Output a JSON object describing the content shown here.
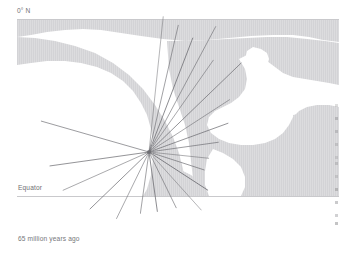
{
  "figure": {
    "caption": "65 million years ago",
    "latitude_label": "0° N",
    "equator_label": "Equator"
  },
  "chart_data": {
    "type": "map",
    "title": "65 million years ago",
    "annotations": [
      {
        "text": "0° N",
        "position": "top-left"
      },
      {
        "text": "Equator",
        "position": "left, above equator line"
      },
      {
        "text": "65 million years ago",
        "position": "bottom-left caption"
      }
    ],
    "reference_lines": [
      {
        "name": "top-border",
        "y": 19,
        "x_start": 17,
        "x_end": 339
      },
      {
        "name": "equator",
        "y": 196,
        "x_start": 17,
        "x_end": 339
      }
    ],
    "radial_burst": {
      "origin": {
        "x": 149,
        "y": 152
      },
      "ray_count": 21,
      "rays": [
        {
          "angle_deg": -84,
          "length": 136
        },
        {
          "angle_deg": -77,
          "length": 130
        },
        {
          "angle_deg": -69,
          "length": 122
        },
        {
          "angle_deg": -62,
          "length": 142
        },
        {
          "angle_deg": -55,
          "length": 112
        },
        {
          "angle_deg": -44,
          "length": 128
        },
        {
          "angle_deg": -33,
          "length": 96
        },
        {
          "angle_deg": -20,
          "length": 84
        },
        {
          "angle_deg": -8,
          "length": 70
        },
        {
          "angle_deg": 6,
          "length": 60
        },
        {
          "angle_deg": 18,
          "length": 58
        },
        {
          "angle_deg": 33,
          "length": 70
        },
        {
          "angle_deg": 48,
          "length": 78
        },
        {
          "angle_deg": 64,
          "length": 62
        },
        {
          "angle_deg": 82,
          "length": 60
        },
        {
          "angle_deg": 98,
          "length": 62
        },
        {
          "angle_deg": 116,
          "length": 74
        },
        {
          "angle_deg": 136,
          "length": 82
        },
        {
          "angle_deg": 156,
          "length": 94
        },
        {
          "angle_deg": 172,
          "length": 100
        },
        {
          "angle_deg": 196,
          "length": 112
        }
      ]
    },
    "colors": {
      "ocean": "#ffffff",
      "land": "#dcdcde",
      "land_stripe": "#d2d2d5",
      "ray": "#6e6e73",
      "guide_line": "#c9c9cc",
      "label_text": "#6f7073",
      "caption_text": "#76777a"
    }
  }
}
